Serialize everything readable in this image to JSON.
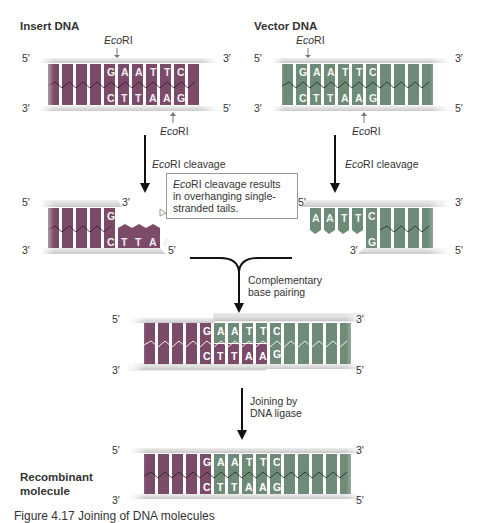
{
  "titles": {
    "insert": "Insert DNA",
    "vector": "Vector DNA",
    "recombinant_line1": "Recombinant",
    "recombinant_line2": "molecule"
  },
  "enzyme": {
    "name_italic": "Eco",
    "name_rest": "RI"
  },
  "ends": {
    "five": "5′",
    "three": "3′"
  },
  "steps": {
    "cleavage": "cleavage",
    "pairing_line1": "Complementary",
    "pairing_line2": "base pairing",
    "ligase_line1": "Joining by",
    "ligase_line2": "DNA ligase"
  },
  "callout": {
    "italic": "Eco",
    "rest": "RI cleavage results in overhanging single-stranded tails."
  },
  "sequence": {
    "top": [
      "G",
      "A",
      "A",
      "T",
      "T",
      "C"
    ],
    "bottom": [
      "C",
      "T",
      "T",
      "A",
      "A",
      "G"
    ]
  },
  "colors": {
    "insert_block": "#7b4b69",
    "vector_block": "#6e8b77",
    "backbone": "#d9d9d9",
    "arrow": "#111111"
  },
  "caption": "Figure 4.17 Joining of DNA molecules"
}
